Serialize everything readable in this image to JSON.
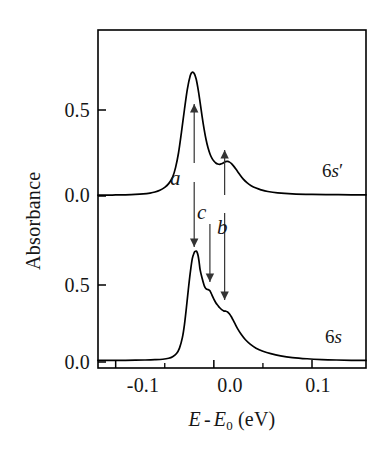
{
  "figure": {
    "kind": "absorption-spectra-stacked"
  },
  "axes": {
    "y_title": "Absorbance",
    "x_title_parts": {
      "e": "E",
      "minus": "-",
      "e0": "E",
      "sub0": "0",
      "units": "(eV)"
    },
    "x_title_plain": "E - E0 (eV)",
    "x_ticks": [
      "-0.1",
      "0.0",
      "0.1"
    ],
    "x_tick_values": [
      -0.1,
      0.0,
      0.1
    ],
    "y_ticks_upper": [
      "0.5",
      "0.0"
    ],
    "y_ticks_lower": [
      "0.5",
      "0.0"
    ],
    "y_tick_values_upper": [
      0.5,
      0.0
    ],
    "y_tick_values_lower": [
      0.5,
      0.0
    ]
  },
  "series_labels": {
    "upper_num": "6",
    "upper_letter": "s",
    "upper_prime": "′",
    "upper_full": "6s′",
    "lower_num": "6",
    "lower_letter": "s",
    "lower_full": "6s"
  },
  "annotations": {
    "a": "a",
    "b": "b",
    "c": "c"
  },
  "colors": {
    "curve": "#000000",
    "frame": "#000000",
    "arrow": "#333333",
    "text": "#161616",
    "background": "#ffffff"
  },
  "chart_data": {
    "type": "line",
    "title": "",
    "subtitle": "",
    "xlabel": "E - E0 (eV)",
    "ylabel": "Absorbance",
    "xlim": [
      -0.118,
      0.155
    ],
    "grid": false,
    "legend_position": "inside-right",
    "panels": [
      {
        "name": "6s'",
        "label": "6s′",
        "ylim": [
          0.0,
          0.95
        ],
        "baseline": 0.0,
        "peaks": [
          {
            "label": "a",
            "x": -0.022,
            "y": 0.72
          },
          {
            "label": "b",
            "x": 0.012,
            "y": 0.2
          }
        ],
        "x": [
          -0.118,
          -0.11,
          -0.1,
          -0.09,
          -0.08,
          -0.072,
          -0.065,
          -0.06,
          -0.055,
          -0.05,
          -0.046,
          -0.042,
          -0.039,
          -0.036,
          -0.033,
          -0.03,
          -0.027,
          -0.024,
          -0.022,
          -0.02,
          -0.018,
          -0.016,
          -0.014,
          -0.012,
          -0.01,
          -0.008,
          -0.006,
          -0.004,
          -0.002,
          0.0,
          0.002,
          0.004,
          0.006,
          0.008,
          0.01,
          0.012,
          0.014,
          0.016,
          0.018,
          0.02,
          0.023,
          0.026,
          0.03,
          0.034,
          0.038,
          0.043,
          0.048,
          0.055,
          0.065,
          0.08,
          0.1,
          0.12,
          0.14,
          0.155
        ],
        "y": [
          0.005,
          0.005,
          0.006,
          0.007,
          0.009,
          0.012,
          0.017,
          0.023,
          0.033,
          0.05,
          0.072,
          0.11,
          0.165,
          0.25,
          0.37,
          0.5,
          0.62,
          0.7,
          0.72,
          0.712,
          0.68,
          0.62,
          0.545,
          0.465,
          0.392,
          0.33,
          0.282,
          0.246,
          0.22,
          0.203,
          0.192,
          0.186,
          0.184,
          0.188,
          0.194,
          0.2,
          0.201,
          0.197,
          0.188,
          0.175,
          0.152,
          0.128,
          0.098,
          0.076,
          0.06,
          0.046,
          0.036,
          0.026,
          0.018,
          0.012,
          0.009,
          0.008,
          0.007,
          0.007
        ]
      },
      {
        "name": "6s",
        "label": "6s",
        "ylim": [
          0.0,
          0.95
        ],
        "baseline": 0.0,
        "peaks": [
          {
            "label": "a",
            "x": -0.018,
            "y": 0.72
          },
          {
            "label": "c",
            "x": -0.005,
            "y": 0.47
          },
          {
            "label": "b",
            "x": 0.01,
            "y": 0.33
          }
        ],
        "x": [
          -0.118,
          -0.11,
          -0.1,
          -0.09,
          -0.08,
          -0.07,
          -0.06,
          -0.052,
          -0.046,
          -0.042,
          -0.038,
          -0.035,
          -0.032,
          -0.03,
          -0.028,
          -0.026,
          -0.024,
          -0.022,
          -0.02,
          -0.019,
          -0.018,
          -0.017,
          -0.016,
          -0.015,
          -0.014,
          -0.012,
          -0.01,
          -0.009,
          -0.008,
          -0.007,
          -0.006,
          -0.005,
          -0.004,
          -0.003,
          -0.002,
          0.0,
          0.002,
          0.004,
          0.006,
          0.008,
          0.01,
          0.012,
          0.014,
          0.016,
          0.018,
          0.021,
          0.024,
          0.028,
          0.032,
          0.037,
          0.043,
          0.05,
          0.058,
          0.068,
          0.08,
          0.095,
          0.11,
          0.125,
          0.14,
          0.155
        ],
        "y": [
          0.01,
          0.01,
          0.01,
          0.011,
          0.012,
          0.013,
          0.015,
          0.018,
          0.024,
          0.034,
          0.055,
          0.09,
          0.16,
          0.24,
          0.35,
          0.47,
          0.58,
          0.67,
          0.71,
          0.718,
          0.72,
          0.712,
          0.69,
          0.65,
          0.6,
          0.545,
          0.5,
          0.485,
          0.476,
          0.472,
          0.47,
          0.468,
          0.462,
          0.45,
          0.436,
          0.408,
          0.385,
          0.368,
          0.352,
          0.34,
          0.332,
          0.33,
          0.325,
          0.312,
          0.292,
          0.255,
          0.218,
          0.178,
          0.146,
          0.116,
          0.09,
          0.07,
          0.054,
          0.04,
          0.029,
          0.021,
          0.016,
          0.013,
          0.011,
          0.01
        ]
      }
    ],
    "arrows": [
      {
        "label": "a",
        "from_panel": "6s'",
        "to_panel": "6s",
        "x": -0.02,
        "direction": "both"
      },
      {
        "label": "c",
        "from_panel": "6s'",
        "to_panel": "6s",
        "x": -0.004,
        "direction": "down"
      },
      {
        "label": "b",
        "from_panel": "6s'",
        "to_panel": "6s",
        "x": 0.011,
        "direction": "both"
      }
    ]
  }
}
